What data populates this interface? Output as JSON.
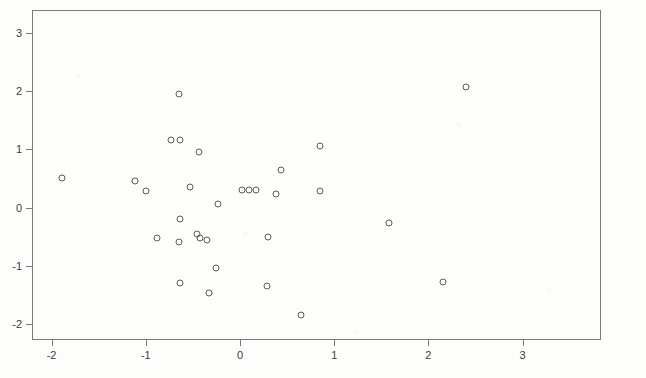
{
  "figure": {
    "width": 646,
    "height": 378,
    "background_color": "#fdfdfc",
    "axis_color": "#7a7a7a",
    "marker_color": "#5a5a5a",
    "label_color": "#3b3b3b"
  },
  "plot_area": {
    "left": 32,
    "top": 10,
    "right": 601,
    "bottom": 340,
    "x_pixel_zero": 240,
    "y_pixel_zero": 207.6,
    "x_pixels_per_unit": 94.2,
    "y_pixels_per_unit": 58.2
  },
  "chart_data": {
    "type": "scatter",
    "title": "",
    "subtitle": "",
    "xlabel": "",
    "ylabel": "",
    "xlim": [
      -2.21,
      3.83
    ],
    "ylim": [
      -2.28,
      3.39
    ],
    "xticks": [
      -2,
      -1,
      0,
      1,
      2,
      3
    ],
    "xticklabels": [
      "-2",
      "-1",
      "0",
      "1",
      "2",
      "3"
    ],
    "yticks": [
      3,
      2,
      1,
      0,
      -1,
      -2
    ],
    "yticklabels": [
      "3",
      "2",
      "1",
      "0",
      "-1",
      "-2"
    ],
    "grid": false,
    "legend": null,
    "marker": "open-circle",
    "n_points": 31,
    "points": [
      {
        "x": -1.89,
        "y": 0.51
      },
      {
        "x": -1.11,
        "y": 0.45
      },
      {
        "x": -1.0,
        "y": 0.29
      },
      {
        "x": -0.65,
        "y": 1.96
      },
      {
        "x": -0.73,
        "y": 1.16
      },
      {
        "x": -0.64,
        "y": 1.16
      },
      {
        "x": -0.43,
        "y": 0.95
      },
      {
        "x": -0.64,
        "y": -0.19
      },
      {
        "x": -0.53,
        "y": 0.35
      },
      {
        "x": -0.88,
        "y": -0.52
      },
      {
        "x": -0.65,
        "y": -0.59
      },
      {
        "x": -0.46,
        "y": -0.45
      },
      {
        "x": -0.35,
        "y": -0.55
      },
      {
        "x": -0.23,
        "y": 0.07
      },
      {
        "x": -0.25,
        "y": -1.04
      },
      {
        "x": -0.64,
        "y": -1.29
      },
      {
        "x": -0.33,
        "y": -1.47
      },
      {
        "x": 0.1,
        "y": 0.31
      },
      {
        "x": 0.17,
        "y": 0.3
      },
      {
        "x": 0.3,
        "y": -0.5
      },
      {
        "x": 0.38,
        "y": 0.23
      },
      {
        "x": 0.43,
        "y": 0.65
      },
      {
        "x": 0.29,
        "y": -1.34
      },
      {
        "x": 0.65,
        "y": -1.84
      },
      {
        "x": 0.85,
        "y": 1.06
      },
      {
        "x": 0.85,
        "y": 0.28
      },
      {
        "x": 1.58,
        "y": -0.26
      },
      {
        "x": 2.16,
        "y": -1.27
      },
      {
        "x": 2.4,
        "y": 2.08
      },
      {
        "x": 0.02,
        "y": 0.3
      },
      {
        "x": -0.42,
        "y": -0.53
      }
    ]
  }
}
